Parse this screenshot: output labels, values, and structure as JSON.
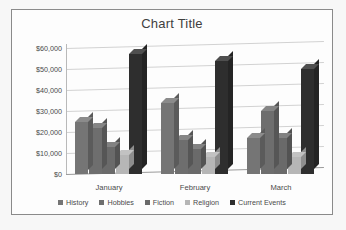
{
  "chart_data": {
    "type": "bar",
    "title": "Chart Title",
    "xlabel": "",
    "ylabel": "",
    "categories": [
      "January",
      "February",
      "March"
    ],
    "series": [
      {
        "name": "History",
        "values": [
          25000,
          34000,
          17000
        ],
        "color": "#757575"
      },
      {
        "name": "Hobbies",
        "values": [
          22000,
          16000,
          30000
        ],
        "color": "#6e6e6e"
      },
      {
        "name": "Fiction",
        "values": [
          13000,
          12000,
          17000
        ],
        "color": "#6a6a6a"
      },
      {
        "name": "Religion",
        "values": [
          9000,
          8000,
          8000
        ],
        "color": "#b6b6b6"
      },
      {
        "name": "Current Events",
        "values": [
          57000,
          54000,
          50000
        ],
        "color": "#2e2e2e"
      }
    ],
    "ylim": [
      0,
      60000
    ],
    "ytick_labels": [
      "$60,000",
      "$50,000",
      "$40,000",
      "$30,000",
      "$20,000",
      "$10,000",
      "$0"
    ],
    "ytick_values": [
      60000,
      50000,
      40000,
      30000,
      20000,
      10000,
      0
    ],
    "grid": true,
    "legend_position": "bottom",
    "style": "3d-clustered-column"
  }
}
